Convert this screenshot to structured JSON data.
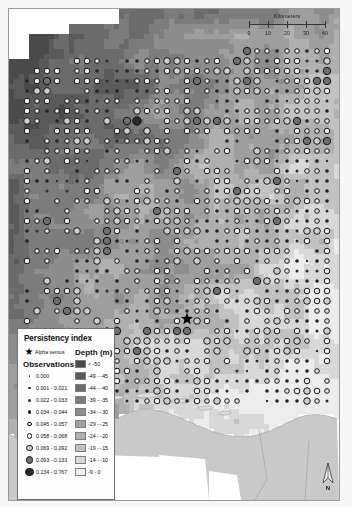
{
  "map": {
    "title": "Persistency index map of the German Bight",
    "background_color": "#f7f7f7",
    "frame_color": "#9a9a9a"
  },
  "scalebar": {
    "unit_label": "Kilometers",
    "ticks": [
      "0",
      "10",
      "20",
      "30",
      "40"
    ],
    "max_km": 40
  },
  "north_arrow": {
    "label": "N"
  },
  "legend": {
    "title": "Persistency index",
    "site": {
      "icon": "star-icon",
      "label": "Alpha ventus"
    },
    "observations_header": "Observations",
    "depth_header": "Depth (m)",
    "observations": [
      {
        "label": "0.000",
        "size": 1.6,
        "fill": "#3a3a3a",
        "ring": false
      },
      {
        "label": "0.001 - 0.021",
        "size": 2.4,
        "fill": "#2e2e2e",
        "ring": false
      },
      {
        "label": "0.022 - 0.033",
        "size": 3.0,
        "fill": "#2b2b2b",
        "ring": false
      },
      {
        "label": "0.034 - 0.044",
        "size": 3.6,
        "fill": "#242424",
        "ring": false
      },
      {
        "label": "0.045 - 0.057",
        "size": 4.6,
        "fill": "#e8e8e8",
        "ring": true
      },
      {
        "label": "0.058 - 0.068",
        "size": 5.6,
        "fill": "#efefef",
        "ring": true
      },
      {
        "label": "0.069 - 0.092",
        "size": 6.6,
        "fill": "#cfcfcf",
        "ring": true
      },
      {
        "label": "0.093 - 0.133",
        "size": 7.4,
        "fill": "#6f6f6f",
        "ring": true
      },
      {
        "label": "0.134 - 0.767",
        "size": 8.4,
        "fill": "#2a2a2a",
        "ring": true
      }
    ],
    "depth_classes": [
      {
        "label": "< -50",
        "color": "#4a4a4a"
      },
      {
        "label": "-49 - -45",
        "color": "#5a5a5a"
      },
      {
        "label": "-44 - -40",
        "color": "#6b6b6b"
      },
      {
        "label": "-39 - -35",
        "color": "#7c7c7c"
      },
      {
        "label": "-34 - -30",
        "color": "#8d8d8d"
      },
      {
        "label": "-29 - -25",
        "color": "#9e9e9e"
      },
      {
        "label": "-24 - -20",
        "color": "#b0b0b0"
      },
      {
        "label": "-19 - -15",
        "color": "#c2c2c2"
      },
      {
        "label": "-14 - -10",
        "color": "#d8d8d8"
      },
      {
        "label": "-9 - 0",
        "color": "#ececec"
      }
    ]
  },
  "chart_data": {
    "type": "map",
    "projection_note": "German Bight, North Sea",
    "raster_layer": "bathymetry depth classes (m)",
    "point_layer": "persistency index observations",
    "site_marker": {
      "name": "Alpha ventus",
      "x": 186,
      "y": 318
    },
    "grid_spacing_px": 10
  }
}
